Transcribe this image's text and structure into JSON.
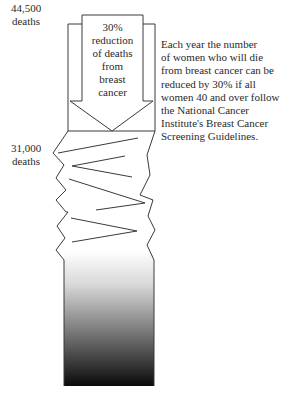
{
  "diagram": {
    "top_label": [
      "44,500",
      "deaths"
    ],
    "mid_label": [
      "31,000",
      "deaths"
    ],
    "arrow_text": [
      "30%",
      "reduction",
      "of deaths",
      "from",
      "breast",
      "cancer"
    ],
    "description_lines": [
      "Each year the number",
      "of women who will die",
      "from breast cancer can be",
      "reduced by 30% if all",
      "women 40 and over follow",
      "the National Cancer",
      "Institute's Breast Cancer",
      "Screening Guidelines."
    ],
    "colors": {
      "stroke": "#3a3a3a",
      "gradient_top": "#ffffff",
      "gradient_bottom": "#0a0a0a"
    }
  }
}
